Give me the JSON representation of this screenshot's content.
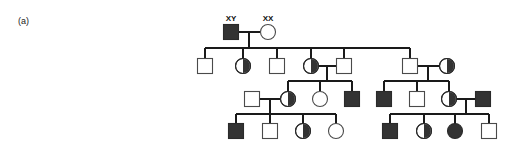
{
  "figure": {
    "panel_label": "(a)",
    "title": "",
    "colors": {
      "affected_fill": "#333333",
      "unaffected_fill": "#ffffff",
      "line": "#1a1a1a",
      "outline": "#4a4a4a"
    },
    "genotype_labels": [
      {
        "id": "g1-father-genotype",
        "text": "XY",
        "x": 231,
        "y": 21
      },
      {
        "id": "g1-mother-genotype",
        "text": "XX",
        "x": 268,
        "y": 21
      }
    ],
    "generations": [
      {
        "id": "generation-1",
        "row_y": 32,
        "members": [
          {
            "id": "I-1",
            "shape": "square",
            "sex": "male",
            "status": "affected",
            "fill": "full",
            "cx": 231,
            "cy": 32,
            "size": 15
          },
          {
            "id": "I-2",
            "shape": "circle",
            "sex": "female",
            "status": "unaffected",
            "fill": "open",
            "cx": 268,
            "cy": 32,
            "size": 15
          }
        ]
      },
      {
        "id": "generation-2",
        "row_y": 66,
        "members": [
          {
            "id": "II-1",
            "shape": "square",
            "sex": "male",
            "status": "unaffected",
            "fill": "open",
            "cx": 205,
            "cy": 66,
            "size": 15
          },
          {
            "id": "II-2",
            "shape": "circle",
            "sex": "female",
            "status": "carrier",
            "fill": "half",
            "cx": 243,
            "cy": 66,
            "size": 15
          },
          {
            "id": "II-3",
            "shape": "square",
            "sex": "male",
            "status": "unaffected",
            "fill": "open",
            "cx": 277,
            "cy": 66,
            "size": 15
          },
          {
            "id": "II-4",
            "shape": "circle",
            "sex": "female",
            "status": "carrier",
            "fill": "half",
            "cx": 311,
            "cy": 66,
            "size": 15
          },
          {
            "id": "II-5",
            "shape": "square",
            "sex": "male",
            "status": "unaffected",
            "fill": "open",
            "cx": 344,
            "cy": 66,
            "size": 15
          },
          {
            "id": "II-6",
            "shape": "square",
            "sex": "male",
            "status": "unaffected",
            "fill": "open",
            "cx": 410,
            "cy": 66,
            "size": 15
          },
          {
            "id": "II-7",
            "shape": "circle",
            "sex": "female",
            "status": "carrier",
            "fill": "half",
            "cx": 447,
            "cy": 66,
            "size": 15
          }
        ]
      },
      {
        "id": "generation-3",
        "row_y": 99,
        "members": [
          {
            "id": "III-1",
            "shape": "square",
            "sex": "male",
            "status": "unaffected",
            "fill": "open",
            "cx": 252,
            "cy": 99,
            "size": 15
          },
          {
            "id": "III-2",
            "shape": "circle",
            "sex": "female",
            "status": "carrier",
            "fill": "half",
            "cx": 288,
            "cy": 99,
            "size": 15
          },
          {
            "id": "III-3",
            "shape": "circle",
            "sex": "female",
            "status": "unaffected",
            "fill": "open",
            "cx": 320,
            "cy": 99,
            "size": 15
          },
          {
            "id": "III-4",
            "shape": "square",
            "sex": "male",
            "status": "affected",
            "fill": "full",
            "cx": 352,
            "cy": 99,
            "size": 15
          },
          {
            "id": "III-5",
            "shape": "square",
            "sex": "male",
            "status": "affected",
            "fill": "full",
            "cx": 384,
            "cy": 99,
            "size": 15
          },
          {
            "id": "III-6",
            "shape": "square",
            "sex": "male",
            "status": "unaffected",
            "fill": "open",
            "cx": 417,
            "cy": 99,
            "size": 15
          },
          {
            "id": "III-7",
            "shape": "circle",
            "sex": "female",
            "status": "carrier",
            "fill": "half",
            "cx": 449,
            "cy": 99,
            "size": 15
          },
          {
            "id": "III-8",
            "shape": "square",
            "sex": "male",
            "status": "affected",
            "fill": "full",
            "cx": 483,
            "cy": 99,
            "size": 15
          }
        ]
      },
      {
        "id": "generation-4",
        "row_y": 131,
        "members": [
          {
            "id": "IV-1",
            "shape": "square",
            "sex": "male",
            "status": "affected",
            "fill": "full",
            "cx": 236,
            "cy": 131,
            "size": 15
          },
          {
            "id": "IV-2",
            "shape": "square",
            "sex": "male",
            "status": "unaffected",
            "fill": "open",
            "cx": 270,
            "cy": 131,
            "size": 15
          },
          {
            "id": "IV-3",
            "shape": "circle",
            "sex": "female",
            "status": "carrier",
            "fill": "half",
            "cx": 303,
            "cy": 131,
            "size": 15
          },
          {
            "id": "IV-4",
            "shape": "circle",
            "sex": "female",
            "status": "unaffected",
            "fill": "open",
            "cx": 336,
            "cy": 131,
            "size": 15
          },
          {
            "id": "IV-5",
            "shape": "square",
            "sex": "male",
            "status": "affected",
            "fill": "full",
            "cx": 390,
            "cy": 131,
            "size": 15
          },
          {
            "id": "IV-6",
            "shape": "circle",
            "sex": "female",
            "status": "carrier",
            "fill": "half",
            "cx": 424,
            "cy": 131,
            "size": 15
          },
          {
            "id": "IV-7",
            "shape": "circle",
            "sex": "female",
            "status": "affected",
            "fill": "full",
            "cx": 455,
            "cy": 131,
            "size": 15
          },
          {
            "id": "IV-8",
            "shape": "square",
            "sex": "male",
            "status": "unaffected",
            "fill": "open",
            "cx": 489,
            "cy": 131,
            "size": 15
          }
        ]
      }
    ],
    "mating_lines": [
      {
        "id": "mating-I-1-I-2",
        "x1": 239,
        "x2": 260,
        "y": 32
      },
      {
        "id": "mating-II-4-II-5",
        "x1": 319,
        "x2": 336,
        "y": 66
      },
      {
        "id": "mating-II-6-II-7",
        "x1": 418,
        "x2": 439,
        "y": 66
      },
      {
        "id": "mating-III-1-III-2",
        "x1": 260,
        "x2": 280,
        "y": 99
      },
      {
        "id": "mating-III-7-III-8",
        "x1": 457,
        "x2": 475,
        "y": 99
      }
    ],
    "descent_drops": [
      {
        "id": "drop-I-couple",
        "x": 249,
        "y1": 32,
        "y2": 48
      },
      {
        "id": "drop-II-couple-a",
        "x": 327,
        "y1": 66,
        "y2": 81
      },
      {
        "id": "drop-II-couple-b",
        "x": 428,
        "y1": 66,
        "y2": 81
      },
      {
        "id": "drop-III-couple-a",
        "x": 270,
        "y1": 99,
        "y2": 114
      },
      {
        "id": "drop-III-couple-b",
        "x": 466,
        "y1": 99,
        "y2": 114
      }
    ],
    "sibship_bars": [
      {
        "id": "sibship-gen2",
        "y": 48,
        "x1": 205,
        "x2": 410,
        "children_x": [
          205,
          243,
          277,
          311,
          344,
          410
        ]
      },
      {
        "id": "sibship-gen3-left",
        "y": 81,
        "x1": 288,
        "x2": 352,
        "children_x": [
          288,
          320,
          352
        ]
      },
      {
        "id": "sibship-gen3-right",
        "y": 81,
        "x1": 384,
        "x2": 449,
        "children_x": [
          384,
          417,
          449
        ]
      },
      {
        "id": "sibship-gen4-left",
        "y": 114,
        "x1": 236,
        "x2": 336,
        "children_x": [
          236,
          270,
          303,
          336
        ]
      },
      {
        "id": "sibship-gen4-right",
        "y": 114,
        "x1": 390,
        "x2": 489,
        "children_x": [
          390,
          424,
          455,
          489
        ]
      }
    ]
  }
}
